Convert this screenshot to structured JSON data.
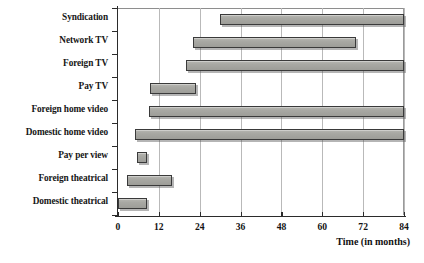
{
  "chart_data": {
    "type": "bar",
    "subtype": "horizontal-floating-bar",
    "title": "",
    "xlabel": "Time (in months)",
    "ylabel": "",
    "xlim": [
      0,
      84
    ],
    "xticks": [
      0,
      12,
      24,
      36,
      48,
      60,
      72,
      84
    ],
    "xtick_labels": [
      "0",
      "12",
      "24",
      "36",
      "48",
      "60",
      "72",
      "84"
    ],
    "grid": true,
    "grid_axis": "x",
    "legend": null,
    "categories": [
      "Syndication",
      "Network TV",
      "Foreign TV",
      "Pay TV",
      "Foreign home video",
      "Domestic home video",
      "Pay per view",
      "Foreign theatrical",
      "Domestic theatrical"
    ],
    "bars": [
      {
        "category": "Syndication",
        "start": 30,
        "end": 84
      },
      {
        "category": "Network TV",
        "start": 22,
        "end": 70
      },
      {
        "category": "Foreign TV",
        "start": 20,
        "end": 84
      },
      {
        "category": "Pay TV",
        "start": 9.5,
        "end": 23
      },
      {
        "category": "Foreign home video",
        "start": 9,
        "end": 84
      },
      {
        "category": "Domestic home video",
        "start": 5,
        "end": 84
      },
      {
        "category": "Pay per view",
        "start": 5.5,
        "end": 8.5
      },
      {
        "category": "Foreign theatrical",
        "start": 2.5,
        "end": 16
      },
      {
        "category": "Domestic theatrical",
        "start": 0,
        "end": 8.5
      }
    ],
    "colors": {
      "bar_fill": "#a8a8a3",
      "bar_border": "#3a3a3a",
      "gridline": "#b9b9b9",
      "axis": "#2b2b2b",
      "text": "#131313",
      "background": "#ffffff"
    }
  }
}
